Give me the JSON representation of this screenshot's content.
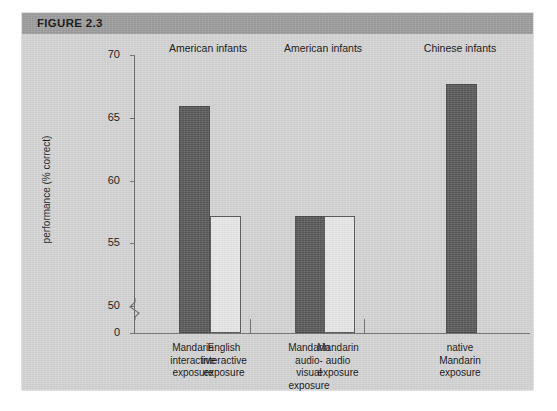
{
  "figure": {
    "header_label": "FIGURE 2.3",
    "header_bg": "#9c9c9c",
    "page_bg": "#d3d3d3"
  },
  "chart_data": {
    "type": "bar",
    "title": "FIGURE 2.3",
    "xlabel": "",
    "ylabel": "performance (% correct)",
    "ylim": [
      0,
      70
    ],
    "axis_break": true,
    "axis_break_between": [
      0,
      50
    ],
    "yticks": [
      "70",
      "65",
      "60",
      "55",
      "50",
      "0"
    ],
    "ytick_values": [
      70,
      65,
      60,
      55,
      50,
      0
    ],
    "grid": false,
    "legend": "none",
    "bar_colors": {
      "dark": "#595959",
      "light": "#e6e6e6",
      "edge": "#4a4a4a"
    },
    "groups": [
      {
        "header": "American infants"
      },
      {
        "header": "American infants"
      },
      {
        "header": "Chinese infants"
      }
    ],
    "categories": [
      "Mandarin interactive exposure",
      "English interactive exposure",
      "Mandarin audio-visual exposure",
      "Mandarin audio exposure",
      "native Mandarin exposure"
    ],
    "category_lines": [
      [
        "Mandarin",
        "interactive",
        "exposure"
      ],
      [
        "English",
        "interactive",
        "exposure"
      ],
      [
        "Mandarin",
        "audio-",
        "visual",
        "exposure"
      ],
      [
        "Mandarin",
        "audio",
        "exposure"
      ],
      [
        "native",
        "Mandarin",
        "exposure"
      ]
    ],
    "values": [
      65.8,
      57.0,
      57.0,
      57.0,
      67.5
    ],
    "bar_styles": [
      "dark",
      "light",
      "dark",
      "light",
      "dark"
    ],
    "group_index": [
      0,
      0,
      1,
      1,
      2
    ]
  }
}
